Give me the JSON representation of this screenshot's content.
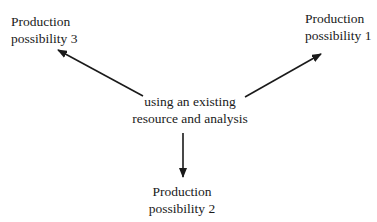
{
  "diagram": {
    "center": {
      "lines": [
        "using an existing",
        "resource and analysis"
      ]
    },
    "nodes": [
      {
        "id": "p1",
        "lines": [
          "Production",
          "possibility 1"
        ],
        "position": "upper-right"
      },
      {
        "id": "p2",
        "lines": [
          "Production",
          "possibility 2"
        ],
        "position": "bottom"
      },
      {
        "id": "p3",
        "lines": [
          "Production",
          "possibility 3"
        ],
        "position": "upper-left"
      }
    ],
    "edges": [
      {
        "from": "center",
        "to": "p1"
      },
      {
        "from": "center",
        "to": "p2"
      },
      {
        "from": "center",
        "to": "p3"
      }
    ],
    "colors": {
      "text": "#1a1a1a",
      "arrow": "#1a1a1a",
      "background": "#ffffff"
    }
  }
}
